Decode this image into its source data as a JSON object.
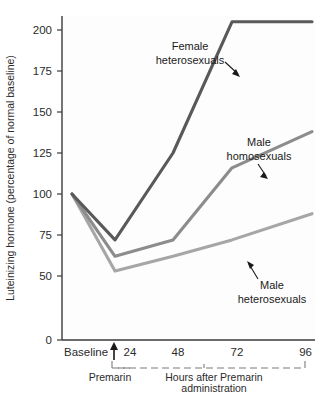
{
  "chart_data": {
    "type": "line",
    "title": "",
    "xlabel": "Hours after Premarin administration",
    "ylabel": "Luteinizing hormone (percentage of normal baseline)",
    "x": [
      "Baseline",
      "24",
      "48",
      "72",
      "96"
    ],
    "categories": [
      "Baseline",
      "24",
      "48",
      "72",
      "96"
    ],
    "yticks": [
      "0",
      "50",
      "75",
      "100",
      "125",
      "150",
      "175",
      "200"
    ],
    "ylim": [
      50,
      210
    ],
    "grid": false,
    "legend_position": "inline-annotations",
    "axis_break": true,
    "series": [
      {
        "name": "Female heterosexuals",
        "color": "#595959",
        "values": [
          100,
          72,
          125,
          205,
          205
        ]
      },
      {
        "name": "Male homosexuals",
        "color": "#8c8c8c",
        "values": [
          100,
          62,
          72,
          116,
          138
        ]
      },
      {
        "name": "Male heterosexuals",
        "color": "#a6a6a6",
        "values": [
          100,
          53,
          62,
          72,
          88
        ]
      }
    ],
    "annotations": [
      {
        "text_line1": "Female",
        "text_line2": "heterosexuals",
        "series": "Female heterosexuals"
      },
      {
        "text_line1": "Male",
        "text_line2": "homosexuals",
        "series": "Male homosexuals"
      },
      {
        "text_line1": "Male",
        "text_line2": "heterosexuals",
        "series": "Male heterosexuals"
      }
    ],
    "x_caption_left": "Premarin",
    "x_caption_right_line1": "Hours after Premarin",
    "x_caption_right_line2": "administration",
    "baseline_marker": "arrow-up"
  },
  "yaxis": {
    "label": "Luteinizing hormone (percentage of normal baseline)",
    "t200": "200",
    "t175": "175",
    "t150": "150",
    "t125": "125",
    "t100": "100",
    "t75": "75",
    "t50": "50",
    "t0": "0"
  },
  "xaxis": {
    "baseline": "Baseline",
    "t24": "24",
    "t48": "48",
    "t72": "72",
    "t96": "96",
    "premarin": "Premarin",
    "hours_line1": "Hours after Premarin",
    "hours_line2": "administration"
  },
  "labels": {
    "female_hetero_l1": "Female",
    "female_hetero_l2": "heterosexuals",
    "male_homo_l1": "Male",
    "male_homo_l2": "homosexuals",
    "male_hetero_l1": "Male",
    "male_hetero_l2": "heterosexuals"
  }
}
